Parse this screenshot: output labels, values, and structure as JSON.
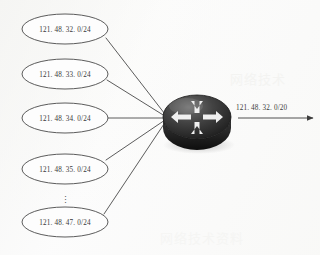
{
  "diagram": {
    "type": "network-topology",
    "background_color": "#fbfbfb",
    "line_color": "#4a4a4a",
    "text_color": "#3a3a3a"
  },
  "subnets": [
    {
      "label": "121. 48. 32. 0/24",
      "cx": 65,
      "cy": 29,
      "rx": 43,
      "ry": 15
    },
    {
      "label": "121. 48. 33. 0/24",
      "cx": 65,
      "cy": 74,
      "rx": 43,
      "ry": 15
    },
    {
      "label": "121. 48. 34. 0/24",
      "cx": 65,
      "cy": 118,
      "rx": 43,
      "ry": 15
    },
    {
      "label": "121. 48. 35. 0/24",
      "cx": 65,
      "cy": 169,
      "rx": 43,
      "ry": 15
    },
    {
      "label": "121. 48. 47. 0/24",
      "cx": 65,
      "cy": 222,
      "rx": 43,
      "ry": 15
    }
  ],
  "continuation": {
    "mark": "⋮",
    "x": 65,
    "y": 200
  },
  "router": {
    "name": "router",
    "icon": "router-icon",
    "cx": 197,
    "cy": 117,
    "rx": 34,
    "ry": 22,
    "body_color": "#2b2b2b",
    "top_color": "#555555",
    "arrow_color": "#f2f2f2",
    "arrows": [
      "left",
      "right",
      "up",
      "down"
    ]
  },
  "aggregate_route": {
    "label": "121. 48. 32. 0/20",
    "label_x": 236,
    "label_y": 108,
    "arrow_from_x": 238,
    "arrow_to_x": 314,
    "arrow_y": 118
  },
  "convergence_point": {
    "x": 168,
    "y": 118
  },
  "watermarks": [
    {
      "text": "网络技术",
      "x": 230,
      "y": 84,
      "opacity": 0.55
    },
    {
      "text": "网络技术资料",
      "x": 160,
      "y": 243,
      "opacity": 0.4
    }
  ]
}
